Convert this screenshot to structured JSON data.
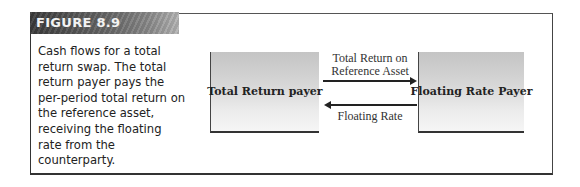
{
  "figure": {
    "label": "FIGURE 8.9",
    "caption": "Cash flows for a total return swap.  The total return payer pays the per-period total return on the reference asset, receiving the floating rate from the counterparty."
  },
  "diagram": {
    "left_party": "Total Return payer",
    "right_party": "Floating Rate Payer",
    "top_flow": {
      "line1": "Total Return on",
      "line2": "Reference Asset",
      "direction": "left-to-right"
    },
    "bottom_flow": {
      "label": "Floating Rate",
      "direction": "right-to-left"
    }
  }
}
